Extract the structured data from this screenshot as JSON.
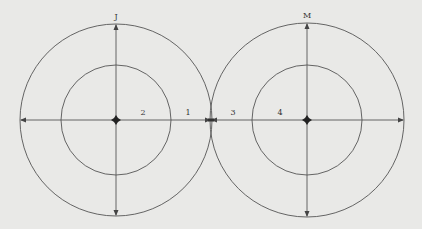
{
  "diagram": {
    "background": "#e9e9e7",
    "stroke_color": "#555555",
    "circles": [
      {
        "id": "left",
        "center": [
          116,
          120
        ],
        "outer_radius": 96,
        "inner_radius": 55,
        "top_label": "J",
        "segment_labels": [
          {
            "text": "2",
            "x": 143,
            "y": 113
          },
          {
            "text": "1",
            "x": 188,
            "y": 113
          }
        ]
      },
      {
        "id": "right",
        "center": [
          307,
          120
        ],
        "outer_radius": 97,
        "inner_radius": 55,
        "top_label": "M",
        "segment_labels": [
          {
            "text": "3",
            "x": 233,
            "y": 113
          },
          {
            "text": "4",
            "x": 280,
            "y": 113
          }
        ]
      }
    ]
  }
}
